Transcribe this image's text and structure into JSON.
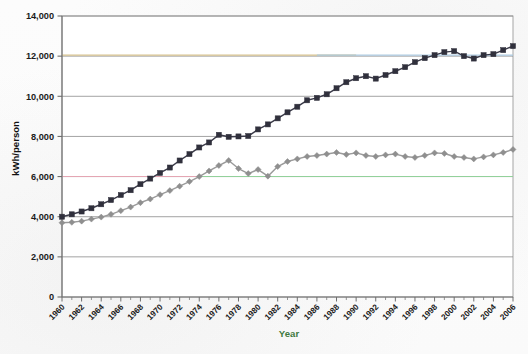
{
  "chart_data": {
    "type": "line",
    "title": "",
    "xlabel": "Year",
    "ylabel": "kWh/person",
    "xlim": [
      1960,
      2006
    ],
    "ylim": [
      0,
      14000
    ],
    "grid": true,
    "grid_axis": "y",
    "legend": "none",
    "x_tick_step": 2,
    "y_tick_step": 2000,
    "x_minor_ticks": true,
    "y_tick_labels": [
      "0",
      "2,000",
      "4,000",
      "6,000",
      "8,000",
      "10,000",
      "12,000",
      "14,000"
    ],
    "x_tick_labels": [
      "1960",
      "1962",
      "1964",
      "1966",
      "1968",
      "1970",
      "1972",
      "1974",
      "1976",
      "1978",
      "1980",
      "1982",
      "1984",
      "1986",
      "1988",
      "1990",
      "1992",
      "1994",
      "1996",
      "1998",
      "2000",
      "2002",
      "2004",
      "2006"
    ],
    "x": [
      1960,
      1961,
      1962,
      1963,
      1964,
      1965,
      1966,
      1967,
      1968,
      1969,
      1970,
      1971,
      1972,
      1973,
      1974,
      1975,
      1976,
      1977,
      1978,
      1979,
      1980,
      1981,
      1982,
      1983,
      1984,
      1985,
      1986,
      1987,
      1988,
      1989,
      1990,
      1991,
      1992,
      1993,
      1994,
      1995,
      1996,
      1997,
      1998,
      1999,
      2000,
      2001,
      2002,
      2003,
      2004,
      2005,
      2006
    ],
    "series": [
      {
        "name": "series-dark-squares",
        "marker": "square",
        "color": "#30303c",
        "line_color": "#3a3a48",
        "values": [
          4000,
          4120,
          4260,
          4420,
          4620,
          4830,
          5080,
          5320,
          5620,
          5900,
          6180,
          6450,
          6800,
          7120,
          7450,
          7700,
          8080,
          7980,
          8000,
          8020,
          8350,
          8600,
          8900,
          9200,
          9480,
          9800,
          9920,
          10100,
          10400,
          10700,
          10900,
          11000,
          10880,
          11060,
          11250,
          11450,
          11700,
          11900,
          12050,
          12200,
          12250,
          12000,
          11880,
          12050,
          12100,
          12300,
          12500
        ]
      },
      {
        "name": "series-gray-diamonds",
        "marker": "diamond",
        "color": "#8f8f8f",
        "line_color": "#9a9a9a",
        "values": [
          3700,
          3720,
          3780,
          3880,
          3980,
          4120,
          4300,
          4480,
          4700,
          4880,
          5100,
          5300,
          5520,
          5750,
          6000,
          6280,
          6550,
          6800,
          6400,
          6150,
          6350,
          6020,
          6500,
          6750,
          6880,
          7000,
          7050,
          7120,
          7200,
          7100,
          7180,
          7050,
          7000,
          7080,
          7120,
          7000,
          6950,
          7050,
          7180,
          7150,
          7000,
          6950,
          6880,
          6980,
          7080,
          7200,
          7350
        ]
      }
    ],
    "reference_lines": [
      {
        "name": "ref-line-6000-pink",
        "y": 6000,
        "color": "#e8a6b4",
        "x_start": 1960,
        "x_end": 2006
      },
      {
        "name": "ref-line-6000-green",
        "y": 6000,
        "color": "#8fd49a",
        "x_start": 1974,
        "x_end": 2006
      },
      {
        "name": "ref-line-12000-tan",
        "y": 12050,
        "color": "#d6c08a",
        "x_start": 1960,
        "x_end": 1990
      },
      {
        "name": "ref-line-12000-blue",
        "y": 12050,
        "color": "#a9c9e2",
        "x_start": 1986,
        "x_end": 2006
      }
    ]
  }
}
